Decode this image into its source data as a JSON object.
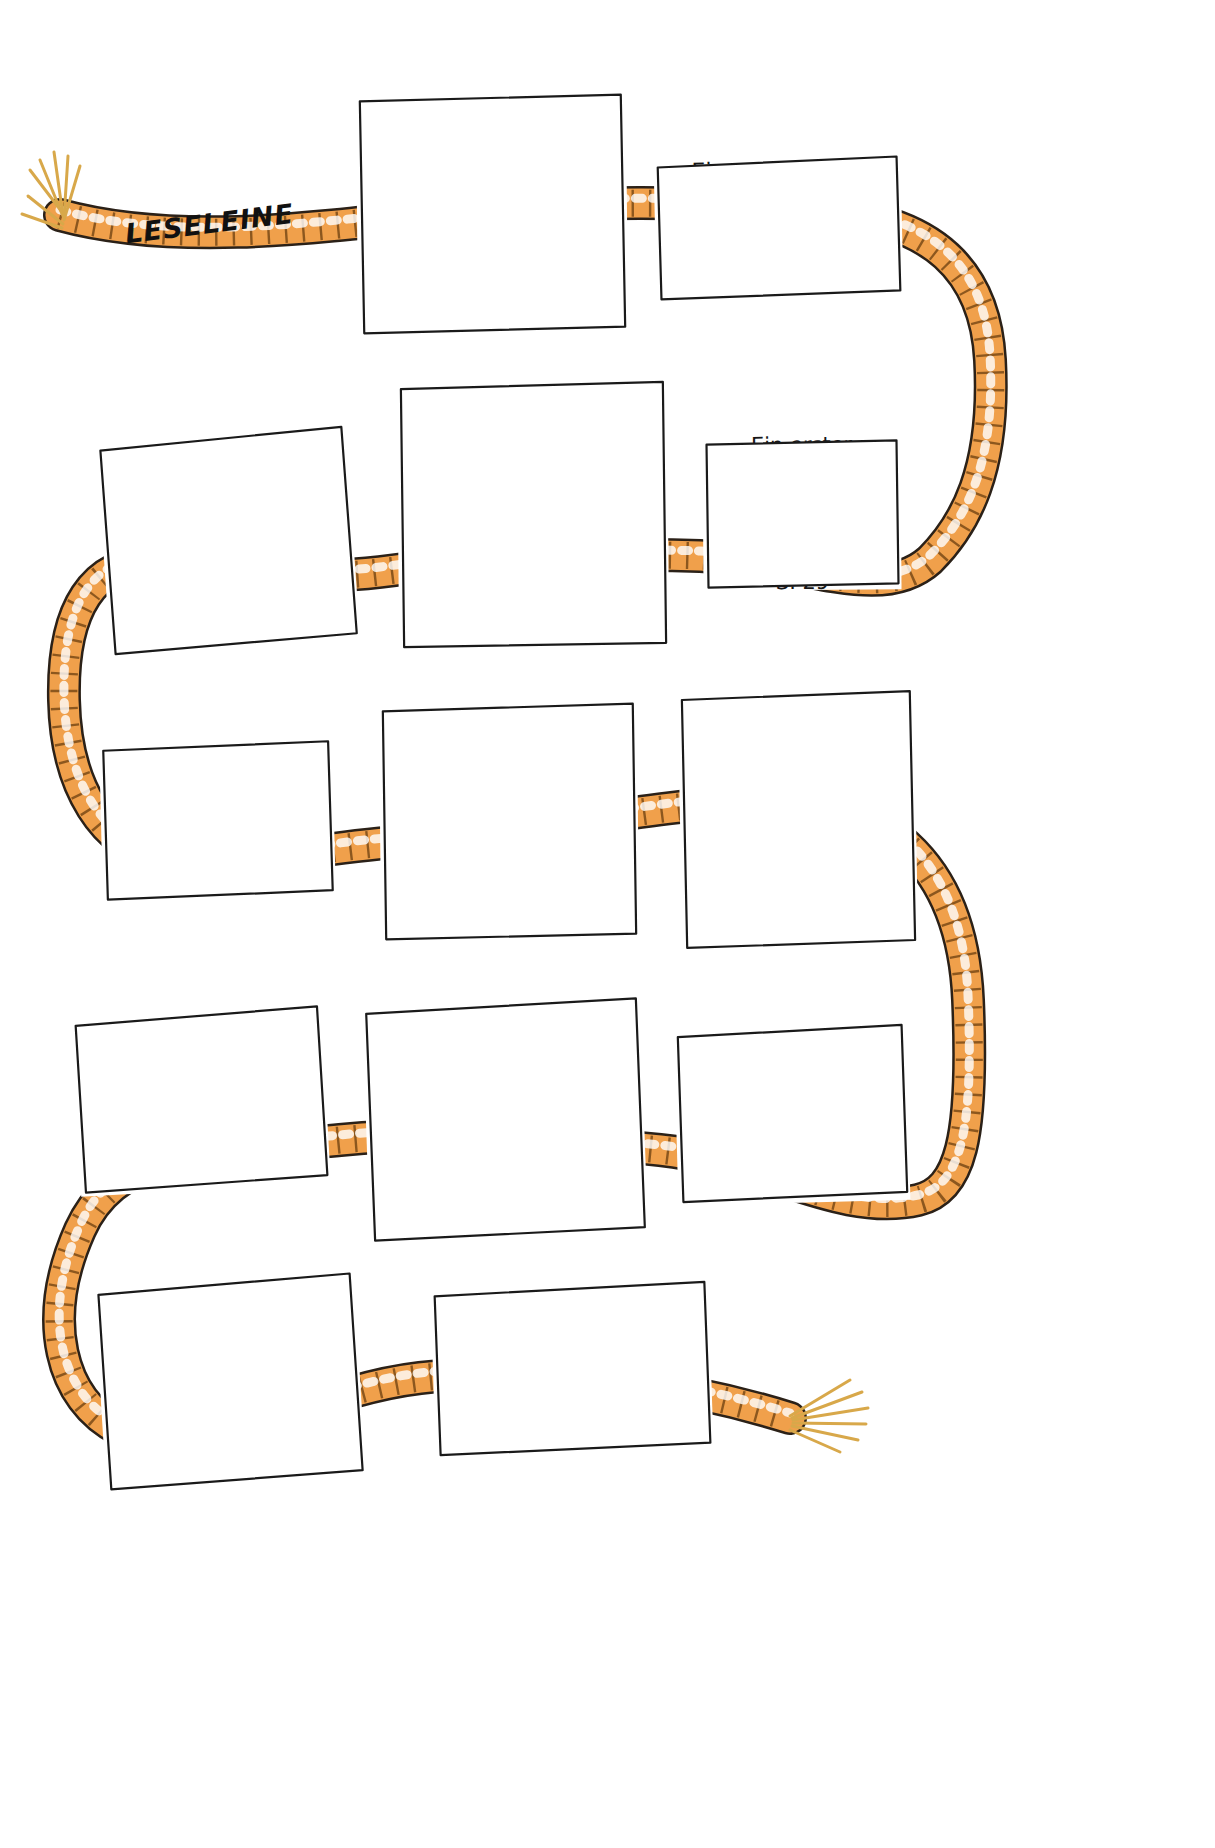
{
  "page": {
    "title": "LESELEINE",
    "banner_label": "LESELEINE",
    "background_color": "#ffffff",
    "rope_color": "#F0A04B",
    "rope_outline": "#2b2118",
    "ink_color": "#161616"
  },
  "cards": [
    {
      "id": "card-1",
      "lines": [
        "Schönstes Wetter",
        "für einen Umzug,",
        "Ausbruch",
        "vor dem Aufbruch,",
        "Abschied und eine",
        "Schmuggelfracht",
        "S. 7"
      ],
      "page_ref": "S. 7",
      "style": "print"
    },
    {
      "id": "card-2",
      "lines": [
        "Ein neues Nest,",
        "das alte Lied",
        "und Zwick und Zwack",
        "S. 20"
      ],
      "page_ref": "S. 20",
      "style": "print"
    },
    {
      "id": "card-3",
      "lines": [
        "Erster Ausflug / 2. Teil:",
        "Der Bernd vertrödelt sich,",
        "ein Mädchen kommt",
        "unter die Räder,",
        "ein Fahrradgeschäft",
        "und lange",
        "kein Hasenfutter",
        "S. 37"
      ],
      "page_ref": "S. 37",
      "style": "print"
    },
    {
      "id": "card-4",
      "lines": [
        "Ein erster Ausflug,",
        "weil der Hasenmist",
        "weg muss",
        "S. 29"
      ],
      "page_ref": "S. 29",
      "style": "print"
    },
    {
      "id": "card-5",
      "lines": [
        "Von Sorgen umzingelt:",
        "Was wird aus Zwick",
        "und Zwack,",
        "die neue Schule",
        "und der fiese Mike",
        "S. 49"
      ],
      "page_ref": "S. 49",
      "style": "print"
    },
    {
      "id": "card-6",
      "lines": [
        "Gute Aussichten,",
        "ein überraschendes",
        "Angebot",
        "S. 58"
      ],
      "page_ref": "S. 58",
      "style": "print"
    },
    {
      "id": "card-7",
      "lines": [
        "Die Miker,",
        "die neue Lederjacke,",
        "eine Mutprobe ...",
        "S. 63"
      ],
      "page_ref": "S. 63",
      "style": "print",
      "annotation_lines": [
        "Eine Mutprobe soll Bernd",
        "ablegen, doch er wird",
        "gefesselt,",
        "Gabi befreit ihn"
      ],
      "annotation_style": "scrawl"
    },
    {
      "id": "card-8",
      "lines": [
        "Der Bernd, die Gabi",
        "und der Schatz",
        "S. 81"
      ],
      "page_ref": "S. 81",
      "style": "print"
    },
    {
      "id": "card-9",
      "lines": [
        "Vorläufiger Schluss,",
        "ein ganz anderer Mike,",
        "was wird aus Papa",
        "S. 113"
      ],
      "page_ref": "S. 113",
      "style": "print"
    },
    {
      "id": "card-10",
      "lines": [
        "Ein Sonntagsausflug,",
        "Besuch in der Vergan-",
        "genheit,",
        "viel zu viel Angeberei,",
        "Abschied von Zwick",
        "und Zwack",
        "S. 105"
      ],
      "page_ref": "S. 105",
      "style": "print"
    },
    {
      "id": "card-11",
      "lines": [
        "Ein neues Bein",
        "und ein",
        "schneller Flitzer",
        "für den Papa",
        "S. 97"
      ],
      "page_ref": "S. 97",
      "style": "print"
    },
    {
      "id": "card-12",
      "lines": [
        "Schnell noch",
        "eine kurze",
        "Nachbemerkung,",
        "bevor das Buch aufhört",
        "S. 123"
      ],
      "page_ref": "S. 123",
      "style": "scrawl"
    },
    {
      "id": "card-13",
      "lines": [
        "Halt –",
        "fast hätt ich's vergessen –",
        "da ist noch was!",
        "S. 125"
      ],
      "page_ref": "S. 125",
      "style": "print"
    }
  ]
}
